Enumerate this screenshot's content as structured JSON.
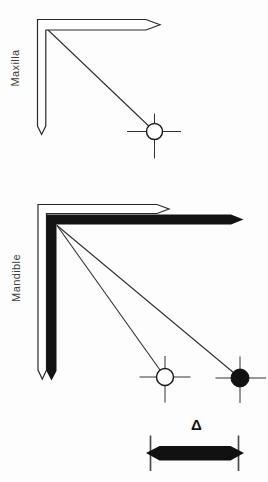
{
  "colors": {
    "ink": "#131313",
    "background": "#fdfdfd",
    "label_text": "#3f3f3f"
  },
  "panels": {
    "maxilla": {
      "label": "Maxilla"
    },
    "mandible": {
      "label": "Mandible"
    }
  },
  "annotation": {
    "delta_symbol": "Δ"
  }
}
